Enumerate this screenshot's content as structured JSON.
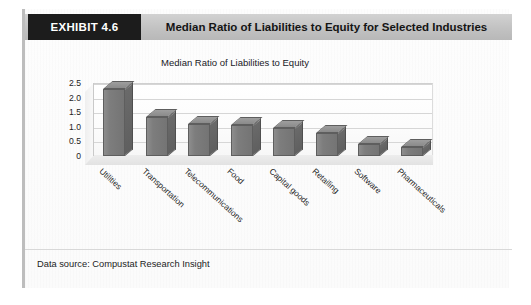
{
  "exhibit": {
    "tag_label": "EXHIBIT 4.6",
    "header_title": "Median Ratio of Liabilities to Equity for Selected Industries",
    "source_note": "Data source: Compustat Research Insight",
    "tag_background": "#1c1c1c",
    "header_background": "#c2c2c2",
    "bar_color": "#7d7d7d"
  },
  "chart_data": {
    "type": "bar",
    "title": "Median Ratio of Liabilities to Equity",
    "xlabel": "",
    "ylabel": "",
    "ylim": [
      0,
      2.5
    ],
    "grid": true,
    "legend": null,
    "three_d": true,
    "categories": [
      "Utilities",
      "Transportation",
      "Telecommunications",
      "Food",
      "Capital goods",
      "Retailing",
      "Software",
      "Pharmaceuticals"
    ],
    "values": [
      2.3,
      1.35,
      1.1,
      1.05,
      0.95,
      0.8,
      0.4,
      0.3
    ],
    "ytick_labels": [
      "2.5",
      "2.0",
      "1.5",
      "1.0",
      "0.5",
      "0"
    ],
    "ytick_values": [
      2.5,
      2.0,
      1.5,
      1.0,
      0.5,
      0
    ]
  }
}
